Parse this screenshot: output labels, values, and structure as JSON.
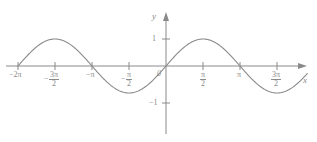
{
  "figure": {
    "kind": "cartesian-plot",
    "line_color": "#8a8a8a",
    "axis_color": "#8a8a8a",
    "background": "#ffffff"
  },
  "axes": {
    "x_label": "x",
    "y_label": "y",
    "origin_label": "0"
  },
  "ticks": {
    "y": [
      {
        "label": "1",
        "value": 1
      },
      {
        "label": "−1",
        "value": -1
      }
    ],
    "x": [
      {
        "label": "−2π",
        "value": -6.2832,
        "kind": "plain"
      },
      {
        "sign": "−",
        "num": "3π",
        "den": "2",
        "value": -4.7124,
        "kind": "fraction"
      },
      {
        "label": "−π",
        "value": -3.1416,
        "kind": "plain"
      },
      {
        "sign": "−",
        "num": "π",
        "den": "2",
        "value": -1.5708,
        "kind": "fraction"
      },
      {
        "sign": "",
        "num": "π",
        "den": "2",
        "value": 1.5708,
        "kind": "fraction"
      },
      {
        "label": "π",
        "value": 3.1416,
        "kind": "plain"
      },
      {
        "sign": "",
        "num": "3π",
        "den": "2",
        "value": 4.7124,
        "kind": "fraction"
      }
    ]
  },
  "chart_data": {
    "type": "line",
    "title": "",
    "xlabel": "x",
    "ylabel": "y",
    "grid": false,
    "legend": null,
    "function": "y = sin(x)",
    "xlim": [
      -7.2,
      6.0
    ],
    "ylim": [
      -1.45,
      1.45
    ],
    "xtick_labels": [
      "−2π",
      "−3π/2",
      "−π",
      "−π/2",
      "π/2",
      "π",
      "3π/2"
    ],
    "xtick_values": [
      -6.2832,
      -4.7124,
      -3.1416,
      -1.5708,
      1.5708,
      3.1416,
      4.7124
    ],
    "ytick_labels": [
      "1",
      "−1"
    ],
    "ytick_values": [
      1,
      -1
    ],
    "series": [
      {
        "name": "sin(x)",
        "color": "#8a8a8a",
        "x": [
          -6.2832,
          -5.8905,
          -5.4978,
          -5.1051,
          -4.7124,
          -4.3197,
          -3.927,
          -3.5343,
          -3.1416,
          -2.7489,
          -2.3562,
          -1.9635,
          -1.5708,
          -1.1781,
          -0.7854,
          -0.3927,
          0.0,
          0.3927,
          0.7854,
          1.1781,
          1.5708,
          1.9635,
          2.3562,
          2.7489,
          3.1416,
          3.5343,
          3.927,
          4.3197,
          4.7124,
          5.1051,
          5.4978,
          5.8905,
          6.0
        ],
        "y": [
          0.0,
          0.3827,
          0.7071,
          0.9239,
          1.0,
          0.9239,
          0.7071,
          0.3827,
          0.0,
          -0.3827,
          -0.7071,
          -0.9239,
          -1.0,
          -0.9239,
          -0.7071,
          -0.3827,
          0.0,
          0.3827,
          0.7071,
          0.9239,
          1.0,
          0.9239,
          0.7071,
          0.3827,
          0.0,
          -0.3827,
          -0.7071,
          -0.9239,
          -1.0,
          -0.9239,
          -0.7071,
          -0.3827,
          -0.2756
        ]
      }
    ],
    "extrema": [
      {
        "type": "maximum",
        "x": -4.7124,
        "y": 1
      },
      {
        "type": "minimum",
        "x": -1.5708,
        "y": -1
      },
      {
        "type": "maximum",
        "x": 1.5708,
        "y": 1
      },
      {
        "type": "minimum",
        "x": 4.7124,
        "y": -1
      }
    ],
    "zeros": [
      -6.2832,
      -3.1416,
      0.0,
      3.1416
    ]
  }
}
